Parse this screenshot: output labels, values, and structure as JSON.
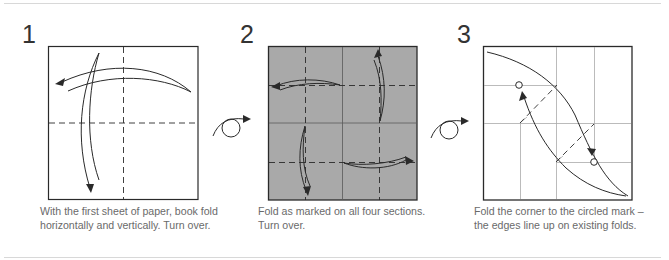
{
  "colors": {
    "line": "#2a2a2a",
    "rule": "#d8d8d8",
    "paper_front": "#ffffff",
    "paper_back": "#a9a9a9",
    "crease": "#aaaaaa",
    "caption_text": "#6a6a6a"
  },
  "steps": [
    {
      "number": "1",
      "caption_lines": [
        "With the first sheet of paper, book fold",
        "horizontally and vertically. Turn over."
      ],
      "paper_side": "white",
      "folds": [
        "valley-fold-vertical",
        "valley-fold-horizontal"
      ]
    },
    {
      "number": "2",
      "caption_lines": [
        "Fold as marked on all four sections.",
        "Turn over."
      ],
      "paper_side": "grey",
      "folds": [
        "valley-fold-top-left",
        "valley-fold-top-right",
        "valley-fold-bottom-left",
        "valley-fold-bottom-right"
      ]
    },
    {
      "number": "3",
      "caption_lines": [
        "Fold the corner to the circled mark –",
        "the edges line up on existing folds."
      ],
      "paper_side": "white",
      "folds": [
        "valley-fold-diagonal-upper",
        "valley-fold-diagonal-lower"
      ]
    }
  ],
  "turn_over_icons": [
    {
      "label": "turn over",
      "between": "1-2"
    },
    {
      "label": "turn over",
      "between": "2-3"
    }
  ]
}
